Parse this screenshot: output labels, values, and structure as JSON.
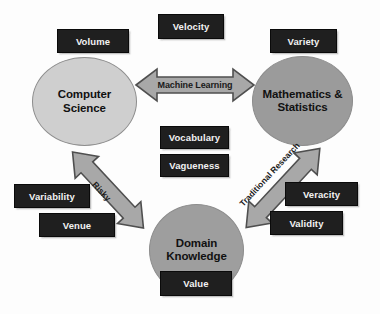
{
  "diagram": {
    "background_color": "#fdfdfd",
    "nodes": [
      {
        "id": "computer-science",
        "line1": "Computer",
        "line2": "Science",
        "fill_color": "#cfcfcf",
        "text_color": "#111111"
      },
      {
        "id": "mathematics-statistics",
        "line1": "Mathematics &",
        "line2": "Statistics",
        "fill_color": "#9b9b9b",
        "text_color": "#111111"
      },
      {
        "id": "domain-knowledge",
        "line1": "Domain",
        "line2": "Knowledge",
        "fill_color": "#9e9e9e",
        "text_color": "#111111"
      }
    ],
    "chips": {
      "volume": "Volume",
      "velocity": "Velocity",
      "variety": "Variety",
      "vocabulary": "Vocabulary",
      "vagueness": "Vagueness",
      "variability": "Variability",
      "venue": "Venue",
      "veracity": "Veracity",
      "validity": "Validity",
      "value": "Value",
      "fill_color": "#1f1f1f",
      "text_color": "#f2f2f2"
    },
    "arrows": [
      {
        "id": "machine-learning",
        "label": "Machine Learning",
        "direction": "bidirectional-horizontal",
        "connects": [
          "computer-science",
          "mathematics-statistics"
        ],
        "fill_color": "#a8a8a8",
        "stroke_color": "#4f4f4f"
      },
      {
        "id": "risky",
        "label": "Risky",
        "direction": "bidirectional-diagonal-down-right",
        "connects": [
          "computer-science",
          "domain-knowledge"
        ],
        "fill_color": "#a8a8a8",
        "stroke_color": "#4f4f4f"
      },
      {
        "id": "traditional-research",
        "label": "Traditional Research",
        "direction": "bidirectional-diagonal-down-left",
        "connects": [
          "mathematics-statistics",
          "domain-knowledge"
        ],
        "fill_color": "#a8a8a8",
        "stroke_color": "#4f4f4f"
      }
    ]
  }
}
